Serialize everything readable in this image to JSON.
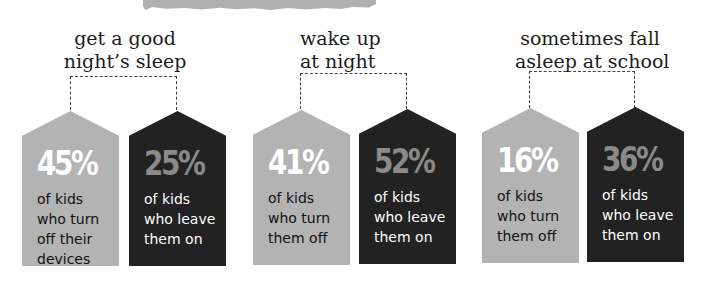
{
  "colors": {
    "light_tag": "#b3b3b3",
    "dark_tag": "#222222",
    "light_pct_text": "#ffffff",
    "dark_pct_text": "#8a8a8a",
    "banner": "#b0b0b0"
  },
  "groups": [
    {
      "caption_line1": "get a good",
      "caption_line2": "night’s sleep",
      "off": {
        "percent": "45%",
        "line1": "of kids",
        "line2": "who turn",
        "line3": "off their",
        "line4": "devices"
      },
      "on": {
        "percent": "25%",
        "line1": "of kids",
        "line2": "who leave",
        "line3": "them on",
        "line4": ""
      }
    },
    {
      "caption_line1": "wake up",
      "caption_line2": "at night",
      "off": {
        "percent": "41%",
        "line1": "of kids",
        "line2": "who turn",
        "line3": "them off",
        "line4": ""
      },
      "on": {
        "percent": "52%",
        "line1": "of kids",
        "line2": "who leave",
        "line3": "them on",
        "line4": ""
      }
    },
    {
      "caption_line1": "sometimes fall",
      "caption_line2": "asleep at school",
      "off": {
        "percent": "16%",
        "line1": "of kids",
        "line2": "who turn",
        "line3": "them off",
        "line4": ""
      },
      "on": {
        "percent": "36%",
        "line1": "of kids",
        "line2": "who leave",
        "line3": "them on",
        "line4": ""
      }
    }
  ]
}
